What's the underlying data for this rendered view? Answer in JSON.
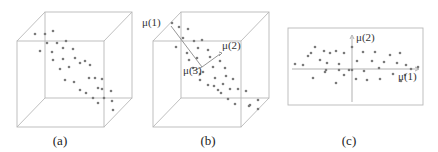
{
  "figure": {
    "panels": [
      {
        "id": "a",
        "caption": "(a)",
        "type": "3d-scatter-cube",
        "description": "Data points in 3D cube, elongated along a diagonal"
      },
      {
        "id": "b",
        "caption": "(b)",
        "type": "3d-scatter-cube-with-principal-axes",
        "axis_labels": [
          "μ(1)",
          "μ(2)",
          "μ(3)"
        ]
      },
      {
        "id": "c",
        "caption": "(c)",
        "type": "2d-projection",
        "axis_labels": {
          "x": "μ(1)",
          "y": "μ(2)"
        }
      }
    ]
  },
  "labels": {
    "cap_a": "(a)",
    "cap_b": "(b)",
    "cap_c": "(c)",
    "b_mu1": "μ(1)",
    "b_mu2": "μ(2)",
    "b_mu3": "μ(3)",
    "c_mu1": "μ(1)",
    "c_mu2": "μ(2)"
  },
  "colors": {
    "edge": "#b8b8b8",
    "dot": "#7a7a7a",
    "text": "#333333"
  },
  "points": {
    "a": [
      [
        35,
        34
      ],
      [
        45,
        34
      ],
      [
        53,
        31
      ],
      [
        47,
        43
      ],
      [
        40,
        51
      ],
      [
        57,
        43
      ],
      [
        66,
        41
      ],
      [
        52,
        52
      ],
      [
        63,
        48
      ],
      [
        73,
        49
      ],
      [
        53,
        60
      ],
      [
        63,
        59
      ],
      [
        75,
        58
      ],
      [
        60,
        69
      ],
      [
        69,
        67
      ],
      [
        85,
        61
      ],
      [
        80,
        63
      ],
      [
        90,
        65
      ],
      [
        65,
        80
      ],
      [
        74,
        82
      ],
      [
        89,
        78
      ],
      [
        95,
        78
      ],
      [
        102,
        79
      ],
      [
        80,
        90
      ],
      [
        86,
        93
      ],
      [
        98,
        88
      ],
      [
        102,
        89
      ],
      [
        111,
        91
      ],
      [
        93,
        98
      ],
      [
        104,
        98
      ],
      [
        112,
        101
      ],
      [
        98,
        103
      ],
      [
        113,
        110
      ]
    ],
    "b": [
      [
        172,
        23
      ],
      [
        179,
        27
      ],
      [
        188,
        29
      ],
      [
        183,
        38
      ],
      [
        176,
        47
      ],
      [
        194,
        41
      ],
      [
        202,
        40
      ],
      [
        187,
        53
      ],
      [
        198,
        48
      ],
      [
        208,
        50
      ],
      [
        189,
        60
      ],
      [
        197,
        58
      ],
      [
        210,
        57
      ],
      [
        193,
        68
      ],
      [
        203,
        72
      ],
      [
        220,
        61
      ],
      [
        213,
        67
      ],
      [
        225,
        68
      ],
      [
        200,
        80
      ],
      [
        215,
        78
      ],
      [
        226,
        76
      ],
      [
        233,
        79
      ],
      [
        218,
        90
      ],
      [
        221,
        93
      ],
      [
        230,
        89
      ],
      [
        238,
        89
      ],
      [
        246,
        91
      ],
      [
        228,
        99
      ],
      [
        235,
        104
      ],
      [
        250,
        105
      ],
      [
        258,
        100
      ],
      [
        249,
        106
      ],
      [
        258,
        109
      ],
      [
        208,
        85
      ],
      [
        214,
        86
      ],
      [
        223,
        84
      ],
      [
        200,
        74
      ]
    ],
    "c": [
      [
        295,
        64
      ],
      [
        303,
        65
      ],
      [
        308,
        56
      ],
      [
        311,
        53
      ],
      [
        315,
        47
      ],
      [
        320,
        60
      ],
      [
        324,
        51
      ],
      [
        326,
        70
      ],
      [
        330,
        53
      ],
      [
        327,
        63
      ],
      [
        336,
        51
      ],
      [
        339,
        64
      ],
      [
        344,
        53
      ],
      [
        336,
        83
      ],
      [
        339,
        70
      ],
      [
        344,
        75
      ],
      [
        352,
        47
      ],
      [
        357,
        61
      ],
      [
        356,
        79
      ],
      [
        363,
        52
      ],
      [
        364,
        71
      ],
      [
        367,
        80
      ],
      [
        372,
        61
      ],
      [
        375,
        52
      ],
      [
        379,
        68
      ],
      [
        380,
        79
      ],
      [
        384,
        62
      ],
      [
        390,
        55
      ],
      [
        393,
        74
      ],
      [
        397,
        63
      ],
      [
        400,
        53
      ],
      [
        401,
        81
      ],
      [
        405,
        75
      ],
      [
        411,
        69
      ],
      [
        418,
        67
      ],
      [
        406,
        65
      ],
      [
        352,
        70
      ],
      [
        325,
        72
      ],
      [
        313,
        78
      ],
      [
        349,
        70
      ]
    ]
  }
}
